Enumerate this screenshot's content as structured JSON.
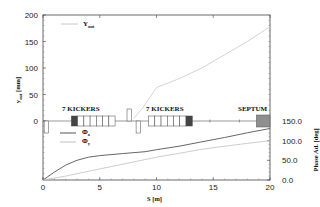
{
  "chart_data": {
    "type": "line",
    "title": "",
    "xlabel": "S [m]",
    "ylabel_left": "y_out [mm]",
    "ylabel_right": "Phase Ad. [deg]",
    "xlim": [
      0,
      20
    ],
    "ylim_left": [
      0,
      200
    ],
    "ylim_right": [
      0,
      150
    ],
    "x_ticks": [
      "0",
      "5",
      "10",
      "15",
      "20"
    ],
    "y_left_ticks": [
      "0",
      "50",
      "100",
      "150",
      "200"
    ],
    "y_right_ticks": [
      "0.0",
      "50.0",
      "100.0",
      "150.0"
    ],
    "grid": false,
    "series": [
      {
        "name": "Y_out",
        "axis": "left",
        "color": "#c8c8c8",
        "x": [
          0,
          2.5,
          5,
          7,
          8,
          8.8,
          10,
          12,
          14,
          16,
          18,
          20
        ],
        "values": [
          0,
          0,
          0,
          0,
          5,
          25,
          63,
          80,
          100,
          125,
          150,
          178
        ]
      },
      {
        "name": "Phi_x",
        "axis": "right",
        "color": "#555555",
        "x": [
          0,
          1,
          2,
          3,
          4,
          5,
          7,
          9,
          10,
          12,
          14,
          16,
          18,
          20
        ],
        "values": [
          0,
          20,
          38,
          50,
          58,
          62,
          67,
          72,
          77,
          86,
          97,
          108,
          120,
          131
        ]
      },
      {
        "name": "Phi_y",
        "axis": "right",
        "color": "#c0c0c0",
        "x": [
          0,
          2,
          4,
          6,
          8,
          10,
          12,
          14,
          16,
          18,
          20
        ],
        "values": [
          0,
          10,
          22,
          34,
          46,
          58,
          68,
          78,
          86,
          93,
          100
        ]
      }
    ],
    "legend": [
      {
        "label": "Y_out",
        "position": "top-left"
      },
      {
        "label": "Φx",
        "position": "middle-left"
      },
      {
        "label": "Φy",
        "position": "middle-left"
      }
    ],
    "annotations": [
      {
        "text": "7 KICKERS",
        "x_range": [
          2.5,
          6.4
        ]
      },
      {
        "text": "7 KICKERS",
        "x_range": [
          9.3,
          13.1
        ]
      },
      {
        "text": "SEPTUM",
        "x_range": [
          18.8,
          20
        ]
      }
    ],
    "lattice_elements": [
      {
        "type": "quad-down",
        "x": 0.3
      },
      {
        "type": "quad-up",
        "x": 7.6
      },
      {
        "type": "quad-down",
        "x": 8.4
      },
      {
        "type": "kicker-group",
        "x_start": 2.5,
        "count": 7,
        "width_each": 0.55
      },
      {
        "type": "kicker-group",
        "x_start": 9.3,
        "count": 7,
        "width_each": 0.55
      },
      {
        "type": "septum",
        "x_start": 18.8,
        "x_end": 20
      }
    ]
  },
  "labels": {
    "y_out_legend": "Y",
    "y_out_legend_sub": "out",
    "phi_x_legend": "Φ",
    "phi_x_sub": "x",
    "phi_y_legend": "Φ",
    "phi_y_sub": "y",
    "kickers_1": "7 KICKERS",
    "kickers_2": "7 KICKERS",
    "septum": "SEPTUM",
    "xlabel": "S [m]",
    "ylabel_left_main": "y",
    "ylabel_left_sub": "out",
    "ylabel_left_unit": " [mm]",
    "ylabel_right": "Phase Ad. [deg]"
  }
}
